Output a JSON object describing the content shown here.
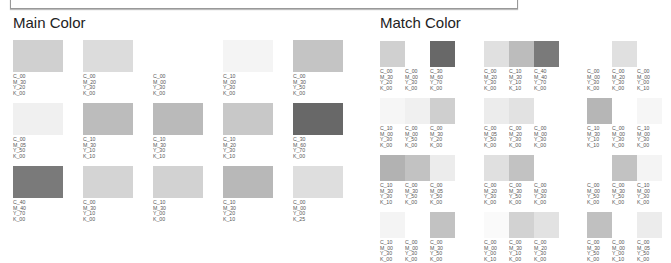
{
  "main": {
    "title": "Main Color",
    "rows": [
      [
        {
          "c": "C_00",
          "m": "M_30",
          "y": "Y_20",
          "k": "K_00",
          "color": "#d0d0d0"
        },
        {
          "c": "C_00",
          "m": "M_20",
          "y": "Y_30",
          "k": "K_00",
          "color": "#dcdcdc"
        },
        {
          "c": "C_00",
          "m": "M_00",
          "y": "Y_30",
          "k": "K_00",
          "color": "#ffffff"
        },
        {
          "c": "C_10",
          "m": "M_00",
          "y": "Y_30",
          "k": "K_00",
          "color": "#f4f4f4"
        },
        {
          "c": "C_00",
          "m": "M_30",
          "y": "Y_50",
          "k": "K_00",
          "color": "#c4c4c4"
        }
      ],
      [
        {
          "c": "C_00",
          "m": "M_05",
          "y": "Y_50",
          "k": "K_00",
          "color": "#f0f0f0"
        },
        {
          "c": "C_10",
          "m": "M_30",
          "y": "Y_10",
          "k": "K_10",
          "color": "#bcbcbc"
        },
        {
          "c": "C_10",
          "m": "M_30",
          "y": "Y_30",
          "k": "K_10",
          "color": "#bababa"
        },
        {
          "c": "C_10",
          "m": "M_20",
          "y": "Y_30",
          "k": "K_10",
          "color": "#c8c8c8"
        },
        {
          "c": "C_30",
          "m": "M_60",
          "y": "Y_70",
          "k": "K_00",
          "color": "#686868"
        }
      ],
      [
        {
          "c": "C_40",
          "m": "M_40",
          "y": "Y_70",
          "k": "K_00",
          "color": "#7a7a7a"
        },
        {
          "c": "C_00",
          "m": "M_30",
          "y": "Y_10",
          "k": "K_00",
          "color": "#d4d4d4"
        },
        {
          "c": "C_10",
          "m": "M_30",
          "y": "Y_00",
          "k": "K_00",
          "color": "#d2d2d2"
        },
        {
          "c": "C_10",
          "m": "M_30",
          "y": "Y_20",
          "k": "K_10",
          "color": "#b8b8b8"
        },
        {
          "c": "C_00",
          "m": "M_00",
          "y": "Y_00",
          "k": "K_25",
          "color": "#dedede"
        }
      ]
    ]
  },
  "match": {
    "title": "Match Color",
    "groups_rows": [
      [
        [
          {
            "c": "C_00",
            "m": "M_30",
            "y": "Y_20",
            "k": "K_00",
            "color": "#d0d0d0"
          },
          {
            "c": "C_00",
            "m": "M_00",
            "y": "Y_30",
            "k": "K_00",
            "color": "#ffffff"
          },
          {
            "c": "C_30",
            "m": "M_60",
            "y": "Y_70",
            "k": "K_00",
            "color": "#686868"
          }
        ],
        [
          {
            "c": "C_00",
            "m": "M_20",
            "y": "Y_30",
            "k": "K_00",
            "color": "#e0e0e0"
          },
          {
            "c": "C_10",
            "m": "M_30",
            "y": "Y_10",
            "k": "K_10",
            "color": "#bcbcbc"
          },
          {
            "c": "C_40",
            "m": "M_40",
            "y": "Y_70",
            "k": "K_00",
            "color": "#7a7a7a"
          }
        ],
        [
          {
            "c": "C_00",
            "m": "M_00",
            "y": "Y_30",
            "k": "K_00",
            "color": "#ffffff"
          },
          {
            "c": "C_00",
            "m": "M_20",
            "y": "Y_30",
            "k": "K_00",
            "color": "#e0e0e0"
          },
          {
            "c": "C_00",
            "m": "M_00",
            "y": "Y_00",
            "k": "K_10",
            "color": "#ffffff"
          }
        ]
      ],
      [
        [
          {
            "c": "C_10",
            "m": "M_00",
            "y": "Y_30",
            "k": "K_00",
            "color": "#f6f6f6"
          },
          {
            "c": "C_00",
            "m": "M_00",
            "y": "Y_50",
            "k": "K_00",
            "color": "#f0f0f0"
          },
          {
            "c": "C_00",
            "m": "M_30",
            "y": "Y_20",
            "k": "K_00",
            "color": "#cfcfcf"
          }
        ],
        [
          {
            "c": "C_00",
            "m": "M_05",
            "y": "Y_50",
            "k": "K_00",
            "color": "#ececec"
          },
          {
            "c": "C_00",
            "m": "M_20",
            "y": "Y_30",
            "k": "K_00",
            "color": "#e2e2e2"
          },
          {
            "c": "C_00",
            "m": "M_00",
            "y": "Y_30",
            "k": "K_00",
            "color": "#ffffff"
          }
        ],
        [
          {
            "c": "C_10",
            "m": "M_30",
            "y": "Y_10",
            "k": "K_10",
            "color": "#b6b6b6"
          },
          {
            "c": "C_00",
            "m": "M_00",
            "y": "Y_30",
            "k": "K_00",
            "color": "#ffffff"
          },
          {
            "c": "C_10",
            "m": "M_00",
            "y": "Y_30",
            "k": "K_00",
            "color": "#f6f6f6"
          }
        ]
      ],
      [
        [
          {
            "c": "C_10",
            "m": "M_30",
            "y": "Y_30",
            "k": "K_10",
            "color": "#b2b2b2"
          },
          {
            "c": "C_00",
            "m": "M_30",
            "y": "Y_50",
            "k": "K_00",
            "color": "#c2c2c2"
          },
          {
            "c": "C_00",
            "m": "M_05",
            "y": "Y_50",
            "k": "K_00",
            "color": "#ececec"
          }
        ],
        [
          {
            "c": "C_00",
            "m": "M_20",
            "y": "Y_30",
            "k": "K_00",
            "color": "#e0e0e0"
          },
          {
            "c": "C_00",
            "m": "M_30",
            "y": "Y_50",
            "k": "K_00",
            "color": "#c2c2c2"
          },
          {
            "c": "C_00",
            "m": "M_00",
            "y": "Y_30",
            "k": "K_00",
            "color": "#ffffff"
          }
        ],
        [
          {
            "c": "C_00",
            "m": "M_00",
            "y": "Y_50",
            "k": "K_00",
            "color": "#ffffff"
          },
          {
            "c": "C_00",
            "m": "M_30",
            "y": "Y_50",
            "k": "K_00",
            "color": "#c2c2c2"
          },
          {
            "c": "C_10",
            "m": "M_00",
            "y": "Y_30",
            "k": "K_00",
            "color": "#f4f4f4"
          }
        ]
      ],
      [
        [
          {
            "c": "C_10",
            "m": "M_00",
            "y": "Y_30",
            "k": "K_00",
            "color": "#f4f4f4"
          },
          {
            "c": "C_00",
            "m": "M_00",
            "y": "Y_30",
            "k": "K_00",
            "color": "#ffffff"
          },
          {
            "c": "C_00",
            "m": "M_30",
            "y": "Y_50",
            "k": "K_00",
            "color": "#c2c2c2"
          }
        ],
        [
          {
            "c": "C_00",
            "m": "M_00",
            "y": "Y_00",
            "k": "K_10",
            "color": "#fafafa"
          },
          {
            "c": "C_00",
            "m": "M_30",
            "y": "Y_10",
            "k": "K_00",
            "color": "#d2d2d2"
          },
          {
            "c": "C_00",
            "m": "M_20",
            "y": "Y_30",
            "k": "K_00",
            "color": "#e2e2e2"
          }
        ],
        [
          {
            "c": "C_00",
            "m": "M_30",
            "y": "Y_50",
            "k": "K_00",
            "color": "#c0c0c0"
          },
          {
            "c": "C_00",
            "m": "M_00",
            "y": "Y_00",
            "k": "K_10",
            "color": "#ffffff"
          },
          {
            "c": "C_00",
            "m": "M_05",
            "y": "Y_50",
            "k": "K_00",
            "color": "#ececec"
          }
        ]
      ]
    ]
  }
}
